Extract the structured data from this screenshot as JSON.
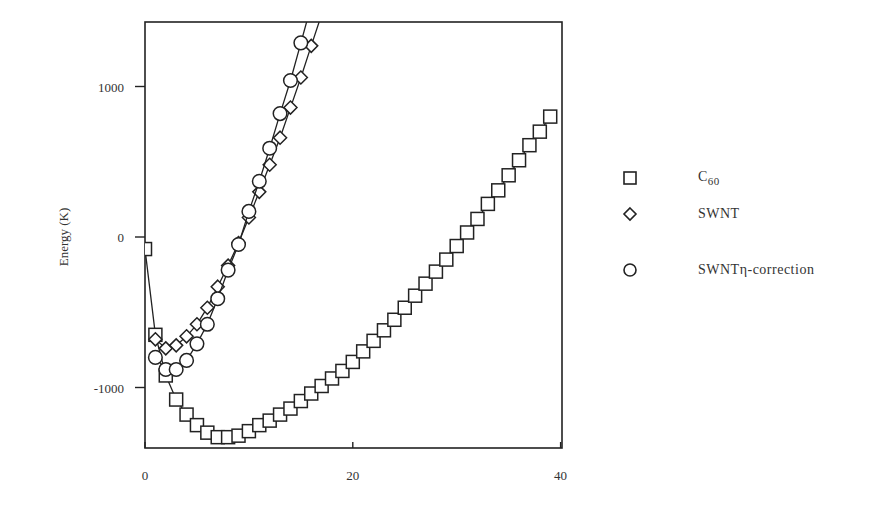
{
  "chart_data": {
    "type": "line",
    "title": "",
    "xlabel": "",
    "ylabel": "Energy (K)",
    "xlim": [
      0,
      40
    ],
    "ylim": [
      -1400,
      1400
    ],
    "x_ticks": [
      "0",
      "20",
      "40"
    ],
    "y_ticks": [
      "1000",
      "0",
      "-1000"
    ],
    "grid": false,
    "legend_position": "right-outside",
    "series": [
      {
        "name": "C60",
        "marker": "square",
        "x": [
          0,
          1,
          2,
          3,
          4,
          5,
          6,
          7,
          8,
          9,
          10,
          11,
          12,
          13,
          14,
          15,
          16,
          17,
          18,
          19,
          20,
          21,
          22,
          23,
          24,
          25,
          26,
          27,
          28,
          29,
          30,
          31,
          32,
          33,
          34,
          35,
          36,
          37,
          38,
          39
        ],
        "y": [
          -80,
          -650,
          -920,
          -1080,
          -1180,
          -1250,
          -1300,
          -1330,
          -1330,
          -1320,
          -1290,
          -1250,
          -1220,
          -1180,
          -1140,
          -1090,
          -1040,
          -990,
          -940,
          -890,
          -830,
          -760,
          -690,
          -620,
          -550,
          -470,
          -390,
          -310,
          -230,
          -150,
          -60,
          30,
          120,
          220,
          310,
          410,
          510,
          610,
          700,
          800
        ]
      },
      {
        "name": "SWNT",
        "marker": "diamond",
        "x": [
          1,
          2,
          3,
          4,
          5,
          6,
          7,
          8,
          9,
          10,
          11,
          12,
          13,
          14,
          15,
          16
        ],
        "y": [
          -680,
          -740,
          -720,
          -660,
          -580,
          -470,
          -330,
          -190,
          -40,
          130,
          300,
          480,
          660,
          860,
          1060,
          1270
        ]
      },
      {
        "name": "SWNT η-correction",
        "marker": "circle",
        "x": [
          1,
          2,
          3,
          4,
          5,
          6,
          7,
          8,
          9,
          10,
          11,
          12,
          13,
          14,
          15
        ],
        "y": [
          -800,
          -880,
          -880,
          -820,
          -710,
          -580,
          -410,
          -220,
          -50,
          170,
          370,
          590,
          820,
          1040,
          1290
        ]
      }
    ]
  },
  "legend": {
    "items": [
      {
        "label": "C",
        "sub": "60",
        "marker": "square-icon"
      },
      {
        "label": "SWNT",
        "sub": "",
        "marker": "diamond-icon"
      },
      {
        "label": "SWNTη-correction",
        "sub": "",
        "marker": "circle-icon"
      }
    ]
  },
  "axes": {
    "ylabel": "Energy (K)",
    "x_ticks": [
      "0",
      "20",
      "40"
    ],
    "y_ticks": [
      "1000",
      "0",
      "-1000"
    ]
  }
}
